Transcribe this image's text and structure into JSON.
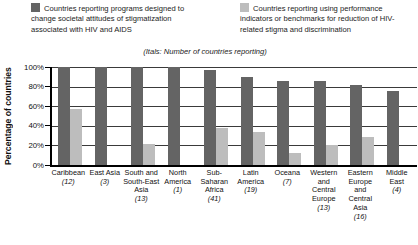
{
  "chart_data": {
    "type": "bar",
    "title": "",
    "subtitle": "(Itals: Number of countries reporting)",
    "ylabel": "Percentage of countries",
    "xlabel": "",
    "ylim": [
      0,
      100
    ],
    "ytick_step": 20,
    "ytick_labels": [
      "0%",
      "20%",
      "40%",
      "60%",
      "80%",
      "100%"
    ],
    "grid": true,
    "legend_position": "top",
    "categories": [
      "Caribbean",
      "East Asia",
      "South and South-East Asia",
      "North America",
      "Sub-Saharan Africa",
      "Latin America",
      "Oceana",
      "Western and Central Europe",
      "Eastern Europe and Central Asia",
      "Middle East"
    ],
    "category_counts": [
      12,
      3,
      13,
      1,
      41,
      19,
      7,
      13,
      16,
      4
    ],
    "series": [
      {
        "key": "programs",
        "name": "Countries reporting programs designed to change societal attitudes of stigmatization associated with HIV and AIDS",
        "color": "#646464",
        "values": [
          100,
          100,
          100,
          100,
          97,
          90,
          86,
          86,
          82,
          75
        ]
      },
      {
        "key": "indicators",
        "name": "Countries reporting using performance indicators or benchmarks for reduction of HIV-related stigma and discrimination",
        "color": "#bdbdbd",
        "values": [
          57,
          0,
          21,
          0,
          38,
          34,
          12,
          20,
          29,
          0
        ]
      }
    ]
  }
}
